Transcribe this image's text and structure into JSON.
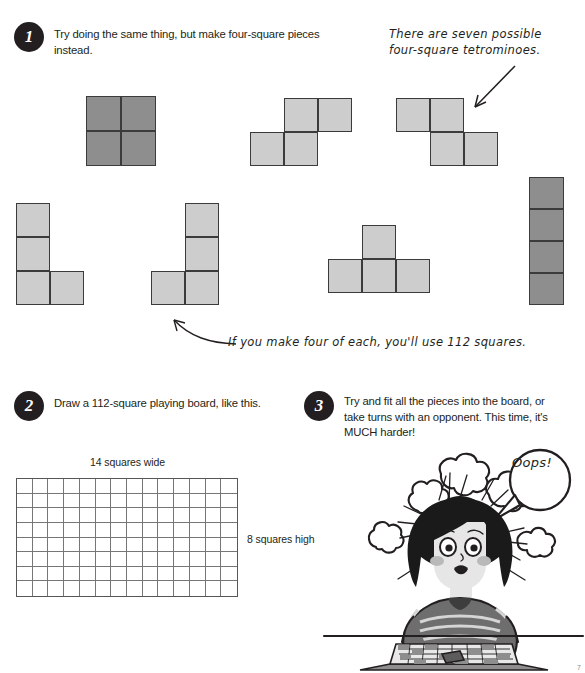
{
  "page": {
    "width": 585,
    "height": 673,
    "background": "#ffffff",
    "ink_color": "#231f20"
  },
  "steps": [
    {
      "number": "1",
      "text": "Try doing the same thing, but make four-square pieces instead."
    },
    {
      "number": "2",
      "text": "Draw a 112-square playing board, like this."
    },
    {
      "number": "3",
      "text": "Try and fit all the pieces into the board, or take turns with an opponent. This time, it's MUCH harder!"
    }
  ],
  "annotations": [
    {
      "id": "seven-tetrominoes-note",
      "line1": "There are seven possible",
      "line2": "four-square tetrominoes."
    },
    {
      "id": "hundred-twelve-note",
      "text": "If you make four of each, you'll use 112 squares."
    }
  ],
  "colors": {
    "piece_light_fill": "#cdcdcd",
    "piece_dark_fill": "#8e8e8e",
    "piece_stroke": "#3b3b3b",
    "board_stroke": "#767676",
    "badge_fill": "#231f20"
  },
  "pieces": [
    {
      "name": "O-piece",
      "shade": "dark",
      "cells": [
        [
          0,
          0
        ],
        [
          1,
          0
        ],
        [
          0,
          1
        ],
        [
          1,
          1
        ]
      ]
    },
    {
      "name": "S-piece",
      "shade": "light",
      "cells": [
        [
          1,
          0
        ],
        [
          2,
          0
        ],
        [
          0,
          1
        ],
        [
          1,
          1
        ]
      ]
    },
    {
      "name": "Z-piece",
      "shade": "light",
      "cells": [
        [
          0,
          0
        ],
        [
          1,
          0
        ],
        [
          1,
          1
        ],
        [
          2,
          1
        ]
      ]
    },
    {
      "name": "L-piece",
      "shade": "light",
      "cells": [
        [
          0,
          0
        ],
        [
          0,
          1
        ],
        [
          0,
          2
        ],
        [
          1,
          2
        ]
      ]
    },
    {
      "name": "J-piece",
      "shade": "light",
      "cells": [
        [
          1,
          0
        ],
        [
          1,
          1
        ],
        [
          0,
          2
        ],
        [
          1,
          2
        ]
      ]
    },
    {
      "name": "T-piece",
      "shade": "light",
      "cells": [
        [
          1,
          0
        ],
        [
          0,
          1
        ],
        [
          1,
          1
        ],
        [
          2,
          1
        ]
      ]
    },
    {
      "name": "I-piece",
      "shade": "dark",
      "cells": [
        [
          0,
          0
        ],
        [
          0,
          1
        ],
        [
          0,
          2
        ],
        [
          0,
          3
        ]
      ]
    }
  ],
  "board": {
    "width_label": "14 squares wide",
    "height_label": "8 squares high",
    "columns": 14,
    "rows": 8,
    "total_squares": 112
  },
  "illustration": {
    "name": "frustrated-girl-at-board",
    "speech_bubble": "Oops!",
    "description": "girl with dark bob hair and striped shirt, steam puffs around head, leaning over a checkered playing board"
  },
  "page_number": "7"
}
